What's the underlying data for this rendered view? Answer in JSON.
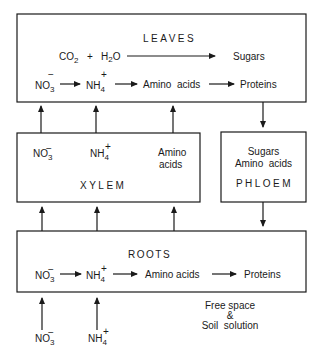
{
  "leaves": {
    "title": "LEAVES",
    "photosynthesis": {
      "reactant1": "CO",
      "reactant1_sub": "2",
      "plus": "+",
      "reactant2a": "H",
      "reactant2_sub": "2",
      "reactant2b": "O",
      "product": "Sugars"
    },
    "nitrogen_path": {
      "nitrate": "NO",
      "nitrate_sub": "3",
      "nitrate_charge": "−",
      "ammonium": "NH",
      "ammonium_sub": "4",
      "ammonium_charge": "+",
      "amino": "Amino  acids",
      "protein": "Proteins"
    }
  },
  "xylem": {
    "title": "XYLEM",
    "nitrate": "NO",
    "nitrate_sub": "3",
    "nitrate_charge": "−",
    "ammonium": "NH",
    "ammonium_sub": "4",
    "ammonium_charge": "+",
    "amino_line1": "Amino",
    "amino_line2": "acids"
  },
  "phloem": {
    "title": "PHLOEM",
    "line1": "Sugars",
    "line2": "Amino  acids"
  },
  "roots": {
    "title": "ROOTS",
    "nitrate": "NO",
    "nitrate_sub": "3",
    "nitrate_charge": "−",
    "ammonium": "NH",
    "ammonium_sub": "4",
    "ammonium_charge": "+",
    "amino": "Amino acids",
    "protein": "Proteins"
  },
  "soil": {
    "line1": "Free space",
    "line2": "&",
    "line3": "Soil  solution",
    "nitrate": "NO",
    "nitrate_sub": "3",
    "nitrate_charge": "−",
    "ammonium": "NH",
    "ammonium_sub": "4",
    "ammonium_charge": "+"
  }
}
